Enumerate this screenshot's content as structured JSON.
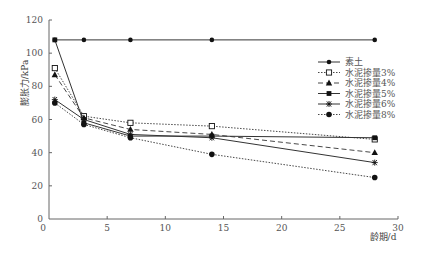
{
  "chart_data": {
    "type": "line",
    "title": "",
    "xlabel": "龄期/d",
    "ylabel": "膨胀力/kPa",
    "xlim": [
      0,
      30
    ],
    "ylim": [
      0,
      120
    ],
    "xticks": [
      0,
      5,
      10,
      15,
      20,
      25,
      30
    ],
    "yticks": [
      0,
      20,
      40,
      60,
      80,
      100,
      120
    ],
    "grid": false,
    "legend_position": "upper right",
    "x": [
      0.5,
      3,
      7,
      14,
      28
    ],
    "series": [
      {
        "name": "素土",
        "marker": "diamond-filled",
        "line": "solid",
        "values": [
          108,
          108,
          108,
          108,
          108
        ]
      },
      {
        "name": "水泥掺量3%",
        "marker": "square-open",
        "line": "dotted",
        "values": [
          91,
          62,
          58,
          56,
          48
        ]
      },
      {
        "name": "水泥掺量4%",
        "marker": "triangle-filled",
        "line": "dashed",
        "values": [
          87,
          61,
          54,
          51,
          40
        ]
      },
      {
        "name": "水泥掺量5%",
        "marker": "square-filled",
        "line": "solid",
        "values": [
          108,
          58,
          50,
          50,
          49
        ]
      },
      {
        "name": "水泥掺量6%",
        "marker": "asterisk",
        "line": "solid",
        "values": [
          72,
          60,
          51,
          49,
          34
        ]
      },
      {
        "name": "水泥掺量8%",
        "marker": "circle-filled",
        "line": "dotted",
        "values": [
          70,
          57,
          49,
          39,
          25
        ]
      }
    ]
  }
}
